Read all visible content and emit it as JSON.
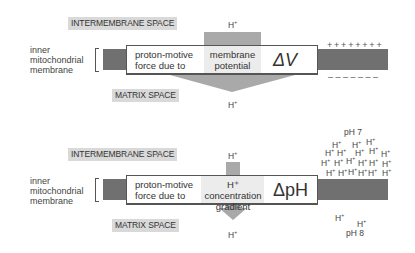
{
  "colors": {
    "membrane": "#707070",
    "arrow": "#a9a9a9",
    "label_bg": "#d9d9d9",
    "box_border": "#555555"
  },
  "panel_top": {
    "intermembrane_label": "INTERMEMBRANE SPACE",
    "matrix_label": "MATRIX SPACE",
    "membrane_label": [
      "inner",
      "mitochondrial",
      "membrane"
    ],
    "box": {
      "line1": "proton-motive",
      "line2": "force due to",
      "cause_line1": "membrane",
      "cause_line2": "potential",
      "symbol": "ΔV"
    },
    "h_top": "H",
    "h_bottom": "H",
    "plus": "+",
    "positive_signs": "++++++++",
    "negative_signs": "– – – – – – –"
  },
  "panel_bottom": {
    "intermembrane_label": "INTERMEMBRANE SPACE",
    "matrix_label": "MATRIX SPACE",
    "membrane_label": [
      "inner",
      "mitochondrial",
      "membrane"
    ],
    "box": {
      "line1": "proton-motive",
      "line2": "force due to",
      "cause_line1": "H⁺ concentration",
      "cause_line2": "gradient",
      "symbol": "ΔpH"
    },
    "h_top": "H",
    "h_bottom": "H",
    "plus": "+",
    "ph_high": "pH 7",
    "ph_low": "pH 8",
    "proton_count_above": 21,
    "proton_count_below": 2
  }
}
